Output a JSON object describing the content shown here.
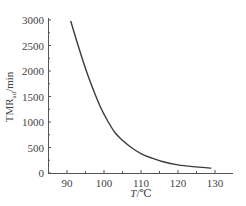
{
  "chart_data": {
    "type": "line",
    "title": "",
    "xlabel": "T/℃",
    "ylabel": "TMRad/min",
    "ylabel_parts": {
      "main": "TMR",
      "sub": "ad",
      "unit": "/min"
    },
    "xlabel_parts": {
      "var": "T",
      "unit": "/℃"
    },
    "xlim": [
      85,
      134
    ],
    "ylim": [
      0,
      3000
    ],
    "x_ticks": [
      90,
      100,
      110,
      120,
      130
    ],
    "y_ticks": [
      0,
      500,
      1000,
      1500,
      2000,
      2500,
      3000
    ],
    "grid": false,
    "legend": null,
    "series": [
      {
        "name": "TMRad",
        "x": [
          91,
          93,
          95,
          97,
          99,
          101,
          103,
          105,
          107,
          110,
          113,
          116,
          120,
          124,
          129
        ],
        "y": [
          2980,
          2500,
          2050,
          1650,
          1300,
          1020,
          790,
          640,
          520,
          380,
          290,
          220,
          160,
          125,
          95
        ]
      }
    ],
    "colors": {
      "line": "#3a3a3a",
      "axis": "#555555"
    }
  }
}
